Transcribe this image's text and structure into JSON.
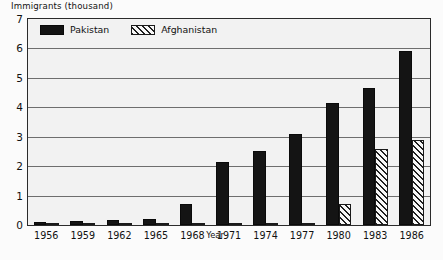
{
  "chart_data": {
    "type": "bar",
    "title": "Immigrants (thousand)",
    "xlabel": "Year",
    "ylabel": "",
    "categories": [
      "1956",
      "1959",
      "1962",
      "1965",
      "1968",
      "1971",
      "1974",
      "1977",
      "1980",
      "1983",
      "1986"
    ],
    "series": [
      {
        "name": "Pakistan",
        "values": [
          0.1,
          0.15,
          0.17,
          0.2,
          0.7,
          2.15,
          2.5,
          3.1,
          4.15,
          4.65,
          5.9
        ]
      },
      {
        "name": "Afghanistan",
        "values": [
          0.02,
          0.03,
          0.05,
          0.05,
          0.05,
          0.06,
          0.07,
          0.08,
          0.7,
          2.6,
          2.9
        ]
      }
    ],
    "ylim": [
      0,
      7
    ],
    "yticks": [
      0,
      1,
      2,
      3,
      4,
      5,
      6,
      7
    ],
    "ytick_labels": [
      "0",
      "1",
      "2",
      "3",
      "4",
      "5",
      "6",
      "7"
    ],
    "grid": true,
    "legend_position": "top-left-inside"
  },
  "legend": {
    "entries": [
      {
        "label": "Pakistan",
        "swatch": "solid-black-swatch"
      },
      {
        "label": "Afghanistan",
        "swatch": "hatched-swatch"
      }
    ]
  }
}
